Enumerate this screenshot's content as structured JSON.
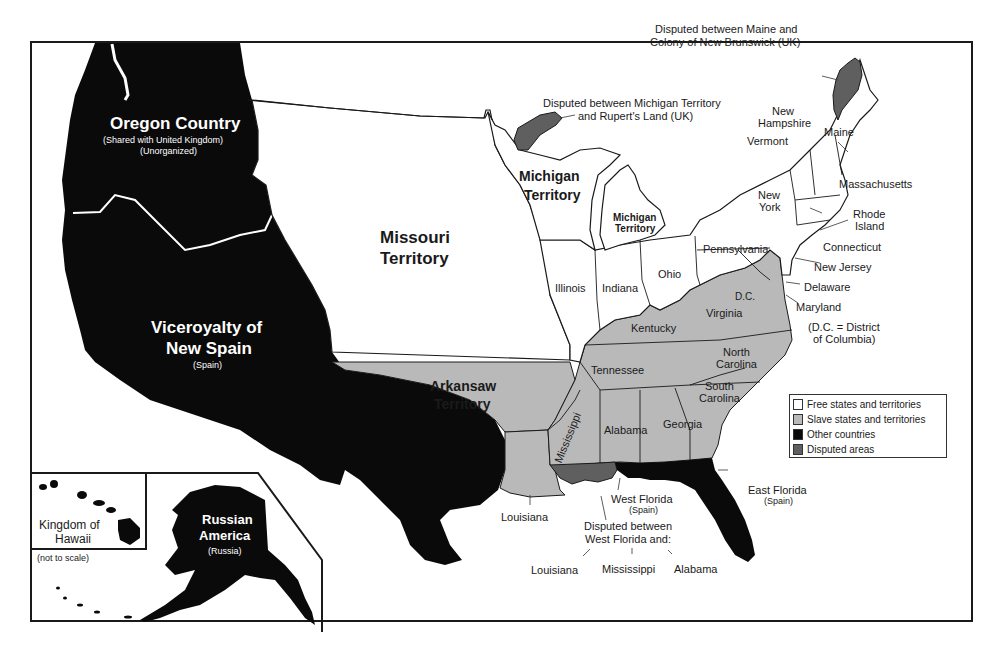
{
  "map": {
    "colors": {
      "free": "#ffffff",
      "slave": "#b9b9b9",
      "other": "#0a0a0a",
      "disputed": "#5f5f5f",
      "border": "#1a1a1a"
    },
    "regions": {
      "oregon_country": {
        "name": "Oregon Country",
        "note1": "(Shared with United Kingdom)",
        "note2": "(Unorganized)"
      },
      "new_spain": {
        "name_line1": "Viceroyalty of",
        "name_line2": "New Spain",
        "note": "(Spain)"
      },
      "missouri_territory": {
        "line1": "Missouri",
        "line2": "Territory"
      },
      "arkansaw_territory": {
        "line1": "Arkansaw",
        "line2": "Territory"
      },
      "michigan_territory_west": {
        "line1": "Michigan",
        "line2": "Territory"
      },
      "michigan_territory_east": {
        "line1": "Michigan",
        "line2": "Territory"
      },
      "russian_america": {
        "line1": "Russian",
        "line2": "America",
        "note": "(Russia)"
      },
      "hawaii": {
        "line1": "Kingdom of",
        "line2": "Hawaii",
        "note": "(not to scale)"
      },
      "west_florida": {
        "name": "West Florida",
        "note": "(Spain)"
      },
      "east_florida": {
        "name": "East Florida",
        "note": "(Spain)"
      }
    },
    "states": {
      "illinois": "Illinois",
      "indiana": "Indiana",
      "ohio": "Ohio",
      "pennsylvania": "Pennsylvania",
      "new_york_1": "New",
      "new_york_2": "York",
      "vermont": "Vermont",
      "new_hampshire_1": "New",
      "new_hampshire_2": "Hampshire",
      "maine": "Maine",
      "massachusetts": "Massachusetts",
      "rhode_island_1": "Rhode",
      "rhode_island_2": "Island",
      "connecticut": "Connecticut",
      "new_jersey": "New Jersey",
      "delaware": "Delaware",
      "maryland": "Maryland",
      "dc": "D.C.",
      "dc_note_1": "(D.C. = District",
      "dc_note_2": "of Columbia)",
      "virginia": "Virginia",
      "kentucky": "Kentucky",
      "north_carolina_1": "North",
      "north_carolina_2": "Carolina",
      "south_carolina_1": "South",
      "south_carolina_2": "Carolina",
      "tennessee": "Tennessee",
      "georgia": "Georgia",
      "alabama": "Alabama",
      "mississippi": "Mississippi",
      "louisiana": "Louisiana"
    },
    "annotations": {
      "maine_dispute_1": "Disputed between Maine and",
      "maine_dispute_2": "Colony of New Brunswick (UK)",
      "michigan_dispute_1": "Disputed between Michigan Territory",
      "michigan_dispute_2": "and Rupert's Land (UK)",
      "wf_dispute_1": "Disputed between",
      "wf_dispute_2": "West Florida and:",
      "wf_louisiana": "Louisiana",
      "wf_mississippi": "Mississippi",
      "wf_alabama": "Alabama"
    },
    "legend": {
      "items": [
        {
          "label": "Free states and territories",
          "color": "#ffffff"
        },
        {
          "label": "Slave states and territories",
          "color": "#b9b9b9"
        },
        {
          "label": "Other countries",
          "color": "#0a0a0a"
        },
        {
          "label": "Disputed areas",
          "color": "#5f5f5f"
        }
      ]
    }
  }
}
